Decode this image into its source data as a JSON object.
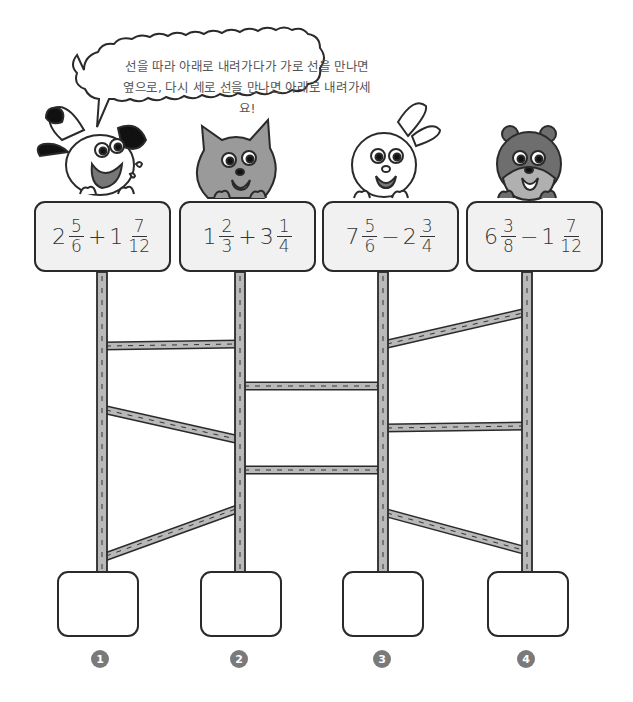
{
  "instruction_bubble": {
    "line1": "선을 따라 아래로 내려가다가 가로 선을 만나면",
    "line2": "옆으로, 다시 세로 선을 만나면 아래로 내려가세요!"
  },
  "characters": [
    {
      "name": "dog",
      "color": "#ffffff"
    },
    {
      "name": "cat",
      "color": "#9a9a9a"
    },
    {
      "name": "rabbit",
      "color": "#ffffff"
    },
    {
      "name": "bear",
      "color": "#6e6e6e"
    }
  ],
  "problems": [
    {
      "id": 1,
      "whole1": "2",
      "num1": "5",
      "den1": "6",
      "op": "+",
      "whole2": "1",
      "num2": "7",
      "den2": "12"
    },
    {
      "id": 2,
      "whole1": "1",
      "num1": "2",
      "den1": "3",
      "op": "+",
      "whole2": "3",
      "num2": "1",
      "den2": "4"
    },
    {
      "id": 3,
      "whole1": "7",
      "num1": "5",
      "den1": "6",
      "op": "−",
      "whole2": "2",
      "num2": "3",
      "den2": "4"
    },
    {
      "id": 4,
      "whole1": "6",
      "num1": "3",
      "den1": "8",
      "op": "−",
      "whole2": "1",
      "num2": "7",
      "den2": "12"
    }
  ],
  "answers": [
    {
      "badge": "1",
      "value": ""
    },
    {
      "badge": "2",
      "value": ""
    },
    {
      "badge": "3",
      "value": ""
    },
    {
      "badge": "4",
      "value": ""
    }
  ],
  "colors": {
    "pole_fill": "#b9b9b9",
    "outline": "#2a2a2a",
    "sign_fill": "#f1f1f1",
    "badge_fill": "#7a7a7a"
  }
}
